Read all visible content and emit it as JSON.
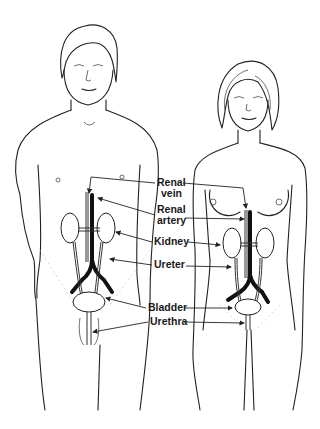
{
  "diagram": {
    "figures": [
      "male",
      "female"
    ],
    "labels": {
      "renal_vein_line1": "Renal",
      "renal_vein_line2": "vein",
      "renal_artery_line1": "Renal",
      "renal_artery_line2": "artery",
      "kidney": "Kidney",
      "ureter": "Ureter",
      "bladder": "Bladder",
      "urethra": "Urethra"
    },
    "colors": {
      "ink": "#1a1a1a",
      "background": "#ffffff"
    }
  }
}
